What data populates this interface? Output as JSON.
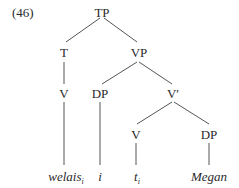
{
  "example_number": "(46)",
  "nodes": {
    "tp": "TP",
    "t": "T",
    "vp": "VP",
    "v_upper": "V",
    "dp_spec": "DP",
    "vbar": "V′",
    "v_lower": "V",
    "dp_obj": "DP"
  },
  "leaves": {
    "welais": {
      "word": "welais",
      "index": "i"
    },
    "i": {
      "word": "i"
    },
    "trace": {
      "word": "t",
      "index": "i"
    },
    "megan": {
      "word": "Megan"
    }
  },
  "line_color": "#555555"
}
